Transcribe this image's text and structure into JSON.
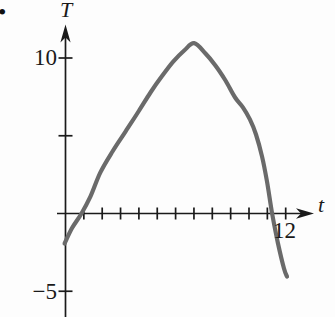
{
  "figure": {
    "bullet_marker": "•"
  },
  "chart_data": {
    "type": "line",
    "title": "",
    "xlabel": "t",
    "ylabel": "T",
    "grid": false,
    "legend": false,
    "xlim": [
      -0.5,
      13.5
    ],
    "ylim": [
      -6.5,
      12
    ],
    "x_axis": {
      "tick_values": [
        1,
        2,
        3,
        4,
        5,
        6,
        7,
        8,
        9,
        10,
        11,
        12
      ],
      "tick_labels": [
        {
          "value": 12,
          "label": "12"
        }
      ]
    },
    "y_axis": {
      "tick_values": [
        10,
        5,
        -5
      ],
      "tick_labels": [
        {
          "value": 10,
          "label": "10"
        },
        {
          "value": -5,
          "label": "−5"
        }
      ]
    },
    "series": [
      {
        "name": "T-curve",
        "color": "#6a6a6a",
        "points": [
          [
            -0.05,
            -1.93
          ],
          [
            0.35,
            -0.95
          ],
          [
            0.87,
            0
          ],
          [
            1.36,
            1.1
          ],
          [
            1.9,
            2.64
          ],
          [
            2.56,
            3.99
          ],
          [
            3.27,
            5.27
          ],
          [
            3.98,
            6.56
          ],
          [
            4.63,
            7.78
          ],
          [
            5.28,
            8.87
          ],
          [
            5.87,
            9.77
          ],
          [
            6.47,
            10.48
          ],
          [
            7.01,
            10.95
          ],
          [
            7.63,
            10.29
          ],
          [
            8.17,
            9.52
          ],
          [
            8.72,
            8.55
          ],
          [
            9.24,
            7.46
          ],
          [
            9.67,
            6.82
          ],
          [
            10.05,
            6.05
          ],
          [
            10.38,
            5.08
          ],
          [
            10.71,
            3.67
          ],
          [
            10.98,
            2.06
          ],
          [
            11.26,
            0
          ],
          [
            11.58,
            -1.93
          ],
          [
            11.91,
            -3.54
          ],
          [
            12.07,
            -4.05
          ]
        ]
      }
    ]
  },
  "colors": {
    "axis": "#1a1a1a",
    "curve": "#6a6a6a",
    "background": "#fdfdfd",
    "text": "#1a1a1a"
  }
}
